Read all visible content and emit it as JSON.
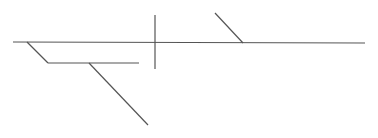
{
  "diagram": {
    "width": 378,
    "height": 138,
    "background": "#ffffff",
    "stroke_color": "#555555",
    "stroke_width": 1.2,
    "segments": [
      {
        "id": "main-spine",
        "x1": 13,
        "y1": 42,
        "x2": 365,
        "y2": 43
      },
      {
        "id": "left-diagonal",
        "x1": 27,
        "y1": 42,
        "x2": 48,
        "y2": 63
      },
      {
        "id": "lower-horizontal-branch",
        "x1": 48,
        "y1": 63,
        "x2": 139,
        "y2": 63
      },
      {
        "id": "lower-diagonal-branch",
        "x1": 89,
        "y1": 63,
        "x2": 148,
        "y2": 125
      },
      {
        "id": "vertical-crossbar",
        "x1": 155,
        "y1": 15,
        "x2": 155,
        "y2": 69
      },
      {
        "id": "upper-right-diagonal",
        "x1": 215,
        "y1": 13,
        "x2": 243,
        "y2": 43
      }
    ]
  }
}
